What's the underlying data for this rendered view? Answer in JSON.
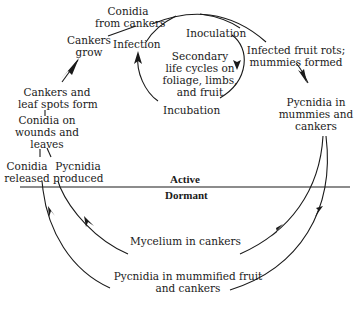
{
  "diagram": {
    "type": "disease-cycle",
    "colors": {
      "ink": "#1a1a1a",
      "background": "#ffffff"
    },
    "divider": {
      "active_label": "Active",
      "dormant_label": "Dormant"
    },
    "nodes": {
      "conidia_from_cankers": [
        "Conidia",
        "from cankers"
      ],
      "cankers_grow": [
        "Cankers",
        "grow"
      ],
      "infection": "Infection",
      "inoculation": "Inoculation",
      "incubation": "Incubation",
      "secondary_cycles": [
        "Secondary",
        "life cycles on",
        "foliage, limbs,",
        "and fruit"
      ],
      "infected_fruit": [
        "Infected fruit rots;",
        "mummies formed"
      ],
      "pycnidia_mummies": [
        "Pycnidia in",
        "mummies and",
        "cankers"
      ],
      "cankers_leaf_spots": [
        "Cankers and",
        "leaf spots form"
      ],
      "conidia_wounds": [
        "Conidia on",
        "wounds and",
        "leaves"
      ],
      "conidia_released": [
        "Conidia",
        "released"
      ],
      "pycnidia_produced": [
        "Pycnidia",
        "produced"
      ],
      "mycelium_cankers": "Mycelium in cankers",
      "pycnidia_mummified": [
        "Pycnidia in mummified fruit",
        "and cankers"
      ]
    },
    "edges": [
      {
        "from": "conidia_from_cankers",
        "to": "infected_fruit"
      },
      {
        "from": "infected_fruit",
        "to": "pycnidia_mummies"
      },
      {
        "from": "pycnidia_mummies",
        "to": "mycelium_cankers"
      },
      {
        "from": "pycnidia_mummies",
        "to": "pycnidia_mummified"
      },
      {
        "from": "mycelium_cankers",
        "to": "pycnidia_produced"
      },
      {
        "from": "pycnidia_mummified",
        "to": "conidia_released"
      },
      {
        "from": "conidia_wounds",
        "to": "cankers_leaf_spots"
      },
      {
        "from": "cankers_leaf_spots",
        "to": "cankers_grow"
      },
      {
        "from": "cankers_grow",
        "to": "conidia_from_cankers"
      },
      {
        "from": "infection",
        "to": "inoculation"
      },
      {
        "from": "inoculation",
        "to": "incubation"
      },
      {
        "from": "incubation",
        "to": "infection"
      }
    ]
  }
}
